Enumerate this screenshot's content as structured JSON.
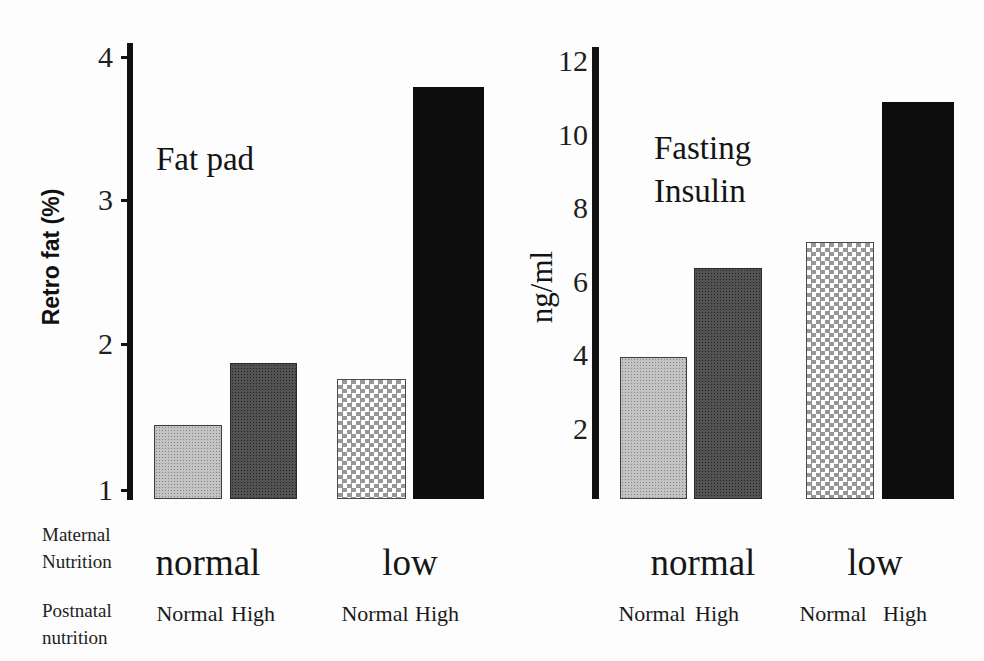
{
  "figure": {
    "row_labels": {
      "maternal": "Maternal Nutrition",
      "postnatal": "Postnatal nutrition"
    },
    "background": "#fdfdfd"
  },
  "colors": {
    "axis": "#111111",
    "text": "#1a1a1a",
    "bar_light_gray": "#c3c3c3",
    "bar_dark_gray": "#535353",
    "bar_checker_gray": "#979797",
    "bar_black": "#0d0d0d"
  },
  "chart_data": [
    {
      "type": "bar",
      "title": "Fat pad",
      "ylabel": "Retro fat (%)",
      "ylim": [
        1,
        4
      ],
      "yticks": [
        "4",
        "3",
        "2",
        "1"
      ],
      "grid": "off",
      "legend": "none",
      "group_axis_label": "Maternal Nutrition",
      "bar_axis_label": "Postnatal nutrition",
      "groups": [
        {
          "label": "normal",
          "bars": [
            {
              "label": "Normal",
              "value": 1.45,
              "pattern": "light-dotted"
            },
            {
              "label": "High",
              "value": 1.88,
              "pattern": "dark-dotted"
            }
          ]
        },
        {
          "label": "low",
          "bars": [
            {
              "label": "Normal",
              "value": 1.77,
              "pattern": "checker"
            },
            {
              "label": "High",
              "value": 3.8,
              "pattern": "solid-black"
            }
          ]
        }
      ]
    },
    {
      "type": "bar",
      "title": "Fasting\nInsulin",
      "ylabel": "ng/ml",
      "ylim": [
        0,
        12
      ],
      "yticks": [
        "12",
        "10",
        "8",
        "6",
        "4",
        "2"
      ],
      "grid": "off",
      "legend": "none",
      "group_axis_label": "Maternal Nutrition",
      "bar_axis_label": "Postnatal nutrition",
      "groups": [
        {
          "label": "normal",
          "bars": [
            {
              "label": "Normal",
              "value": 3.95,
              "pattern": "light-dotted"
            },
            {
              "label": "High",
              "value": 6.4,
              "pattern": "dark-dotted"
            }
          ]
        },
        {
          "label": "low",
          "bars": [
            {
              "label": "Normal",
              "value": 7.1,
              "pattern": "checker"
            },
            {
              "label": "High",
              "value": 10.9,
              "pattern": "solid-black"
            }
          ]
        }
      ]
    }
  ]
}
